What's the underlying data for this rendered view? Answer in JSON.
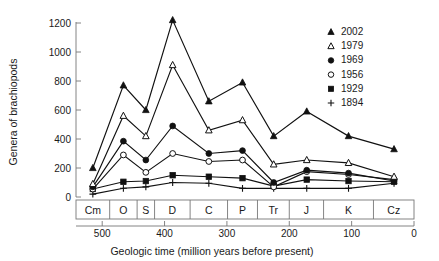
{
  "chart_data": {
    "type": "line",
    "title": "",
    "xlabel": "Geologic time (million years before present)",
    "ylabel": "Genera of brachiopods",
    "xlim": [
      542,
      0
    ],
    "ylim": [
      0,
      1200
    ],
    "x_ticks": [
      500,
      400,
      300,
      200,
      100,
      0
    ],
    "y_ticks": [
      0,
      200,
      400,
      600,
      800,
      1000,
      1200
    ],
    "grid": false,
    "legend_position": "top-right",
    "x_axis_reversed": true,
    "categories": [
      "Cm",
      "O",
      "S",
      "D",
      "C",
      "P",
      "Tr",
      "J",
      "K",
      "Cz"
    ],
    "period_bands": [
      {
        "label": "Cm",
        "start": 542,
        "end": 488
      },
      {
        "label": "O",
        "start": 488,
        "end": 444
      },
      {
        "label": "S",
        "start": 444,
        "end": 416
      },
      {
        "label": "D",
        "start": 416,
        "end": 359
      },
      {
        "label": "C",
        "start": 359,
        "end": 299
      },
      {
        "label": "P",
        "start": 299,
        "end": 251
      },
      {
        "label": "Tr",
        "start": 251,
        "end": 200
      },
      {
        "label": "J",
        "start": 200,
        "end": 145
      },
      {
        "label": "K",
        "start": 145,
        "end": 65
      },
      {
        "label": "Cz",
        "start": 65,
        "end": 0
      }
    ],
    "x": [
      515,
      466,
      430,
      387,
      329,
      275,
      225,
      172,
      105,
      32
    ],
    "series": [
      {
        "name": "2002",
        "marker": "filled-triangle",
        "values": [
          200,
          770,
          600,
          1220,
          660,
          790,
          420,
          590,
          420,
          330
        ]
      },
      {
        "name": "1979",
        "marker": "open-triangle",
        "values": [
          90,
          560,
          420,
          910,
          460,
          530,
          225,
          255,
          235,
          140
        ]
      },
      {
        "name": "1969",
        "marker": "filled-circle",
        "values": [
          70,
          385,
          255,
          490,
          300,
          320,
          100,
          185,
          165,
          110
        ]
      },
      {
        "name": "1956",
        "marker": "open-circle",
        "values": [
          55,
          290,
          170,
          300,
          245,
          255,
          70,
          175,
          155,
          120
        ]
      },
      {
        "name": "1929",
        "marker": "filled-square",
        "values": [
          55,
          105,
          110,
          150,
          140,
          130,
          75,
          120,
          110,
          105
        ]
      },
      {
        "name": "1894",
        "marker": "plus",
        "values": [
          20,
          60,
          70,
          100,
          95,
          60,
          60,
          60,
          60,
          95
        ]
      }
    ]
  },
  "legend": {
    "items": [
      {
        "label": "2002",
        "marker": "filled-triangle"
      },
      {
        "label": "1979",
        "marker": "open-triangle"
      },
      {
        "label": "1969",
        "marker": "filled-circle"
      },
      {
        "label": "1956",
        "marker": "open-circle"
      },
      {
        "label": "1929",
        "marker": "filled-square"
      },
      {
        "label": "1894",
        "marker": "plus"
      }
    ]
  }
}
